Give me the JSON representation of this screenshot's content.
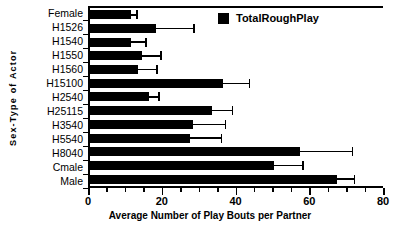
{
  "chart_data": {
    "type": "bar",
    "orientation": "horizontal",
    "title": "",
    "xlabel": "Average Number of Play Bouts per Partner",
    "ylabel": "Sex-Type of Actor",
    "xlim": [
      0,
      80
    ],
    "xticks": [
      0,
      20,
      40,
      60,
      80
    ],
    "xtick_labels": [
      "0",
      "20",
      "40",
      "60",
      "80"
    ],
    "xminor_ticks": [
      5,
      10,
      15,
      25,
      30,
      35,
      45,
      50,
      55,
      65,
      70,
      75
    ],
    "grid": false,
    "legend": {
      "position": "top-right",
      "entries": [
        {
          "name": "TotalRoughPlay",
          "color": "#000000"
        }
      ]
    },
    "categories": [
      "Female",
      "H1526",
      "H1540",
      "H1550",
      "H1560",
      "H15100",
      "H2540",
      "H25115",
      "H3540",
      "H5540",
      "H8040",
      "Cmale",
      "Male"
    ],
    "series": [
      {
        "name": "TotalRoughPlay",
        "color": "#000000",
        "values": [
          11,
          18,
          11,
          14,
          13,
          36,
          16,
          33,
          28,
          27,
          57,
          50,
          67
        ],
        "errors": [
          1.5,
          10,
          4,
          5,
          5,
          7,
          2.5,
          5.5,
          8.5,
          8.5,
          14,
          7.5,
          4.5
        ]
      }
    ]
  },
  "axis": {
    "y_title": "Sex-Type  of  Actor",
    "x_title": "Average Number of Play Bouts per Partner"
  },
  "legend": {
    "label": "TotalRoughPlay"
  }
}
